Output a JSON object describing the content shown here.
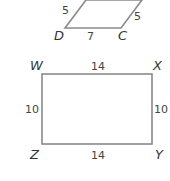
{
  "figures": {
    "parallelogram": {
      "vertices": [
        "D",
        "C"
      ],
      "sides": {
        "left": "5",
        "right": "5",
        "bottom": "7"
      }
    },
    "rectangle": {
      "vertices": [
        "W",
        "X",
        "Y",
        "Z"
      ],
      "sides": {
        "top": "14",
        "bottom": "14",
        "left": "10",
        "right": "10"
      }
    }
  },
  "colors": {
    "stroke": "#8a8a8a",
    "text": "#333333"
  }
}
